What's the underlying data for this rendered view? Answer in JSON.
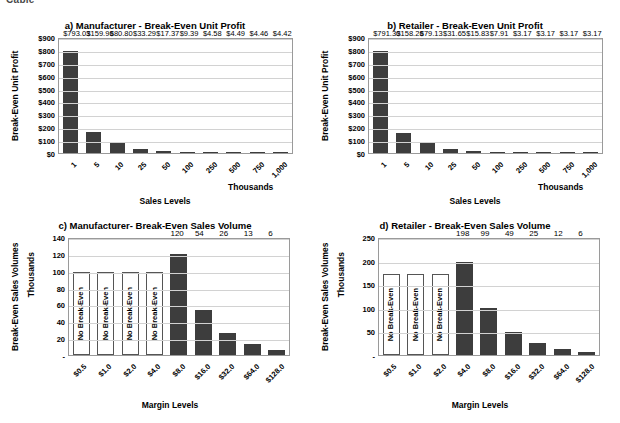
{
  "page": {
    "scrap_text": "Cable"
  },
  "charts": [
    {
      "id": "chart-a",
      "title": "a) Manufacturer - Break-Even Unit Profit",
      "xlabel": "Sales Levels",
      "ylabel": "Break-Even Unit Profit",
      "x_unit_note": "Thousands",
      "y_unit_note": ""
    },
    {
      "id": "chart-b",
      "title": "b) Retailer - Break-Even Unit Profit",
      "xlabel": "Sales Levels",
      "ylabel": "Break-Even Unit Profit",
      "x_unit_note": "Thousands",
      "y_unit_note": ""
    },
    {
      "id": "chart-c",
      "title": "c) Manufacturer- Break-Even Sales Volume",
      "xlabel": "Margin Levels",
      "ylabel": "Break-Even Sales Volumes",
      "x_unit_note": "",
      "y_unit_note": "Thousands"
    },
    {
      "id": "chart-d",
      "title": "d) Retailer - Break-Even Sales Volume",
      "xlabel": "Margin Levels",
      "ylabel": "Break-Even Sales Volumes",
      "x_unit_note": "",
      "y_unit_note": "Thousands"
    }
  ],
  "chart_data": [
    {
      "type": "bar",
      "title": "a) Manufacturer - Break-Even Unit Profit",
      "xlabel": "Sales Levels",
      "ylabel": "Break-Even Unit Profit",
      "x_unit_note": "Thousands",
      "categories": [
        "1",
        "5",
        "10",
        "25",
        "50",
        "100",
        "250",
        "500",
        "750",
        "1,000"
      ],
      "values": [
        793.03,
        159.96,
        80.8,
        33.29,
        17.37,
        9.39,
        4.58,
        4.49,
        4.46,
        4.42
      ],
      "data_labels": [
        "$793.03",
        "$159.96",
        "$80.80",
        "$33.29",
        "$17.37",
        "$9.39",
        "$4.58",
        "$4.49",
        "$4.46",
        "$4.42"
      ],
      "ylim": [
        0,
        900
      ],
      "yticks": [
        0,
        100,
        200,
        300,
        400,
        500,
        600,
        700,
        800,
        900
      ],
      "ytick_labels": [
        "$0",
        "$100",
        "$200",
        "$300",
        "$400",
        "$500",
        "$600",
        "$700",
        "$800",
        "$900"
      ],
      "grid": true,
      "legend": "none",
      "bar_color": "#3d3d3d"
    },
    {
      "type": "bar",
      "title": "b) Retailer - Break-Even Unit Profit",
      "xlabel": "Sales Levels",
      "ylabel": "Break-Even Unit Profit",
      "x_unit_note": "Thousands",
      "categories": [
        "1",
        "5",
        "10",
        "25",
        "50",
        "100",
        "250",
        "500",
        "750",
        "1,000"
      ],
      "values": [
        791.3,
        158.26,
        79.13,
        31.65,
        15.83,
        7.91,
        3.17,
        3.17,
        3.17,
        3.17
      ],
      "data_labels": [
        "$791.30",
        "$158.26",
        "$79.13",
        "$31.65",
        "$15.83",
        "$7.91",
        "$3.17",
        "$3.17",
        "$3.17",
        "$3.17"
      ],
      "ylim": [
        0,
        900
      ],
      "yticks": [
        0,
        100,
        200,
        300,
        400,
        500,
        600,
        700,
        800,
        900
      ],
      "ytick_labels": [
        "$0",
        "$100",
        "$200",
        "$300",
        "$400",
        "$500",
        "$600",
        "$700",
        "$800",
        "$900"
      ],
      "grid": true,
      "legend": "none",
      "bar_color": "#3d3d3d"
    },
    {
      "type": "bar",
      "title": "c) Manufacturer- Break-Even Sales Volume",
      "xlabel": "Margin Levels",
      "ylabel": "Break-Even Sales Volumes",
      "y_unit_note": "Thousands",
      "categories": [
        "$0.5",
        "$1.0",
        "$2.0",
        "$4.0",
        "$8.0",
        "$16.0",
        "$32.0",
        "$64.0",
        "$128.0"
      ],
      "values": [
        null,
        null,
        null,
        null,
        120,
        54,
        26,
        13,
        6
      ],
      "data_labels": [
        "",
        "",
        "",
        "",
        "120",
        "54",
        "26",
        "13",
        "6"
      ],
      "no_break_even_flags": [
        true,
        true,
        true,
        true,
        false,
        false,
        false,
        false,
        false
      ],
      "no_break_even_text": "No Break-Even",
      "no_break_even_bar_height": 98,
      "ylim": [
        0,
        140
      ],
      "yticks": [
        0,
        20,
        40,
        60,
        80,
        100,
        120,
        140
      ],
      "ytick_labels": [
        "-",
        "20",
        "40",
        "60",
        "80",
        "100",
        "120",
        "140"
      ],
      "grid": true,
      "legend": "none",
      "bar_color": "#3d3d3d"
    },
    {
      "type": "bar",
      "title": "d) Retailer - Break-Even Sales Volume",
      "xlabel": "Margin Levels",
      "ylabel": "Break-Even Sales Volumes",
      "y_unit_note": "Thousands",
      "categories": [
        "$0.5",
        "$1.0",
        "$2.0",
        "$4.0",
        "$8.0",
        "$16.0",
        "$32.0",
        "$64.0",
        "$128.0"
      ],
      "values": [
        null,
        null,
        null,
        198,
        99,
        49,
        25,
        12,
        6
      ],
      "data_labels": [
        "",
        "",
        "",
        "198",
        "99",
        "49",
        "25",
        "12",
        "6"
      ],
      "no_break_even_flags": [
        true,
        true,
        true,
        false,
        false,
        false,
        false,
        false,
        false
      ],
      "no_break_even_text": "No Break-Even",
      "no_break_even_bar_height": 172,
      "ylim": [
        0,
        250
      ],
      "yticks": [
        0,
        50,
        100,
        150,
        200,
        250
      ],
      "ytick_labels": [
        "-",
        "50",
        "100",
        "150",
        "200",
        "250"
      ],
      "grid": true,
      "legend": "none",
      "bar_color": "#3d3d3d"
    }
  ]
}
